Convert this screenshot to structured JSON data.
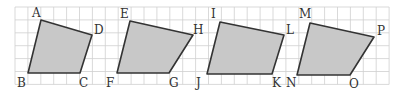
{
  "grid": {
    "x0": 15,
    "y0": 7,
    "cell": 12.9,
    "cols": 29,
    "rows": 6,
    "color": "#cfcfcf"
  },
  "style": {
    "fill": "#c8c8c8",
    "stroke": "#333333"
  },
  "shapes": [
    {
      "name": "ABCD",
      "points": [
        [
          41,
          20
        ],
        [
          92,
          35
        ],
        [
          80,
          73
        ],
        [
          28,
          73
        ]
      ],
      "labels": [
        {
          "text": "A",
          "x": 32,
          "y": 17
        },
        {
          "text": "D",
          "x": 94,
          "y": 34
        },
        {
          "text": "C",
          "x": 79,
          "y": 87
        },
        {
          "text": "B",
          "x": 17,
          "y": 87
        }
      ]
    },
    {
      "name": "EFGH",
      "points": [
        [
          130,
          21
        ],
        [
          193,
          35
        ],
        [
          169,
          73
        ],
        [
          117,
          73
        ]
      ],
      "labels": [
        {
          "text": "E",
          "x": 120,
          "y": 18
        },
        {
          "text": "H",
          "x": 193,
          "y": 34
        },
        {
          "text": "G",
          "x": 169,
          "y": 87
        },
        {
          "text": "F",
          "x": 106,
          "y": 87
        }
      ]
    },
    {
      "name": "IJKL",
      "points": [
        [
          220,
          22
        ],
        [
          284,
          35
        ],
        [
          272,
          74
        ],
        [
          207,
          74
        ]
      ],
      "labels": [
        {
          "text": "I",
          "x": 211,
          "y": 18
        },
        {
          "text": "L",
          "x": 286,
          "y": 34
        },
        {
          "text": "K",
          "x": 272,
          "y": 87
        },
        {
          "text": "J",
          "x": 196,
          "y": 87
        }
      ]
    },
    {
      "name": "MNOP",
      "points": [
        [
          310,
          23
        ],
        [
          374,
          37
        ],
        [
          350,
          75
        ],
        [
          297,
          75
        ]
      ],
      "labels": [
        {
          "text": "M",
          "x": 299,
          "y": 18
        },
        {
          "text": "P",
          "x": 377,
          "y": 35
        },
        {
          "text": "O",
          "x": 349,
          "y": 88
        },
        {
          "text": "N",
          "x": 286,
          "y": 87
        }
      ]
    }
  ]
}
